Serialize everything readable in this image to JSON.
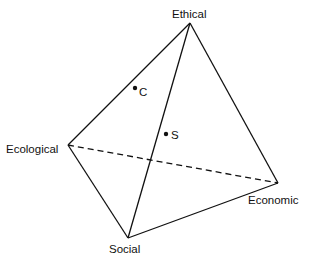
{
  "diagram": {
    "type": "tetrahedron",
    "vertices": {
      "ethical": {
        "label": "Ethical",
        "x": 190,
        "y": 23
      },
      "ecological": {
        "label": "Ecological",
        "x": 68,
        "y": 145
      },
      "economic": {
        "label": "Economic",
        "x": 278,
        "y": 183
      },
      "social": {
        "label": "Social",
        "x": 128,
        "y": 238
      }
    },
    "edges": [
      {
        "from": "ethical",
        "to": "ecological",
        "style": "solid"
      },
      {
        "from": "ethical",
        "to": "social",
        "style": "solid"
      },
      {
        "from": "ethical",
        "to": "economic",
        "style": "solid"
      },
      {
        "from": "ecological",
        "to": "social",
        "style": "solid"
      },
      {
        "from": "social",
        "to": "economic",
        "style": "solid"
      },
      {
        "from": "ecological",
        "to": "economic",
        "style": "dashed"
      }
    ],
    "points": [
      {
        "label": "C",
        "x": 135,
        "y": 88
      },
      {
        "label": "S",
        "x": 166,
        "y": 134
      }
    ]
  }
}
